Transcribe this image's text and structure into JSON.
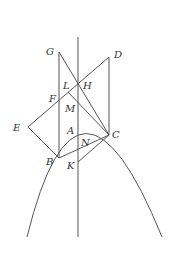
{
  "figure": {
    "stroke_color": "#555555",
    "label_color": "#333333",
    "labels": {
      "G": "G",
      "D": "D",
      "L": "L",
      "H": "H",
      "F": "F",
      "M": "M",
      "E": "E",
      "A": "A",
      "C": "C",
      "N": "N",
      "B": "B",
      "K": "K"
    }
  }
}
